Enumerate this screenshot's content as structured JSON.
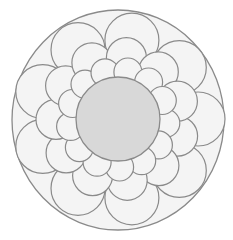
{
  "image": {
    "subject": "flower mandala line drawing",
    "width": 233,
    "height": 240,
    "colors": {
      "background": "#ffffff",
      "paper": "#f4f4f4",
      "line": "#8a8a8a",
      "center_fill": "#d8d8d8"
    },
    "outer_circle": {
      "cx": 118,
      "cy": 120,
      "rx": 106,
      "ry": 110
    },
    "center_disc": {
      "cx": 118,
      "cy": 119,
      "r": 42
    },
    "petal_rings": [
      {
        "name": "outer-ring",
        "count": 9,
        "radius": 80,
        "petal_r": 27,
        "offset_deg": 0
      },
      {
        "name": "middle-ring",
        "count": 11,
        "radius": 62,
        "petal_r": 20,
        "offset_deg": 16
      },
      {
        "name": "inner-ring",
        "count": 13,
        "radius": 48,
        "petal_r": 14,
        "offset_deg": 5
      }
    ]
  }
}
